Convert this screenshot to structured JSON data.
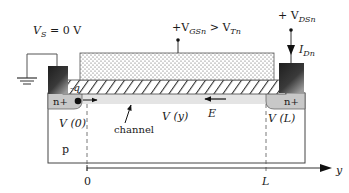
{
  "figure": {
    "source_label": {
      "main": "V",
      "sub": "S",
      "rest": " = 0 V"
    },
    "gate_label": {
      "prefix": "+V",
      "sub1": "GSn",
      "mid": " > V",
      "sub2": "Tn"
    },
    "drain_label": {
      "prefix": "+ V",
      "sub": "DSn"
    },
    "current_label": {
      "main": "I",
      "sub": "Dn"
    },
    "charge_label": "-q",
    "source_region_label": "n+",
    "drain_region_label": "n+",
    "substrate_label": "p",
    "channel_label": "channel",
    "v0_label": "V (0)",
    "vy_label": "V (y)",
    "vl_label": "V (L)",
    "field_label": "E",
    "axis": {
      "label": "y",
      "origin_label": "0",
      "end_label": "L"
    }
  },
  "colors": {
    "outline": "#444444",
    "nplus_fill": "#c8c8c8",
    "channel_fill": "#e4e4e4",
    "gate_dots": "#555555",
    "contact_dark": "#1e1e1e",
    "contact_light": "#9a9a9a"
  }
}
